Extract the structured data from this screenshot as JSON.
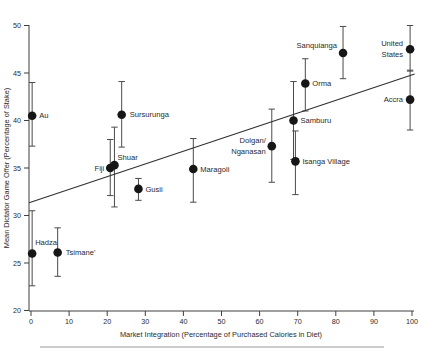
{
  "figure": {
    "background": "#ffffff",
    "axis_color": "#3f3f3f",
    "errorbar_color": "#4a4a4a",
    "point_color": "#161616",
    "text_color": "#2a2a2a",
    "trend_color": "#2f2f2f",
    "footer_rule_color": "#9a9a9a"
  },
  "chart_data": {
    "type": "scatter",
    "title": "",
    "xlabel": "Market Integration (Percentage of Purchased Calories in Diet)",
    "ylabel": "Mean Dictator Game Offer (Percentage of Stake)",
    "xlim": [
      0,
      100
    ],
    "ylim": [
      20,
      50
    ],
    "x_ticks": [
      0,
      10,
      20,
      30,
      40,
      50,
      60,
      70,
      80,
      90,
      100
    ],
    "y_ticks": [
      20,
      25,
      30,
      35,
      40,
      45,
      50
    ],
    "grid": false,
    "legend": null,
    "marker": "filled-circle",
    "error_bars": "vertical-with-caps",
    "points": [
      {
        "name": "Au",
        "x": 0.3,
        "y": 40.5,
        "err_low": 37.3,
        "err_high": 44.0,
        "label_side": "right",
        "label_dx": 7,
        "label_dy": 0,
        "label_lines": [
          "Au"
        ]
      },
      {
        "name": "Hadza",
        "x": 0.3,
        "y": 26.0,
        "err_low": 22.6,
        "err_high": 30.5,
        "label_side": "right",
        "label_dx": 3,
        "label_dy": -11,
        "label_lines": [
          "Hadza"
        ]
      },
      {
        "name": "Tsimane'",
        "x": 7.0,
        "y": 26.1,
        "err_low": 23.6,
        "err_high": 28.7,
        "label_side": "right",
        "label_dx": 8,
        "label_dy": 0,
        "label_lines": [
          "Tsimane'"
        ]
      },
      {
        "name": "Fiji",
        "x": 20.8,
        "y": 35.0,
        "err_low": 32.1,
        "err_high": 38.0,
        "label_side": "left",
        "label_dx": -6,
        "label_dy": 0,
        "label_lines": [
          "Fiji"
        ]
      },
      {
        "name": "Shuar",
        "x": 21.9,
        "y": 35.3,
        "err_low": 30.9,
        "err_high": 39.3,
        "label_side": "right",
        "label_dx": 3,
        "label_dy": -8,
        "label_lines": [
          "Shuar"
        ]
      },
      {
        "name": "Sursurunga",
        "x": 23.8,
        "y": 40.6,
        "err_low": 37.2,
        "err_high": 44.1,
        "label_side": "right",
        "label_dx": 8,
        "label_dy": 0,
        "label_lines": [
          "Sursurunga"
        ]
      },
      {
        "name": "Gusii",
        "x": 28.2,
        "y": 32.8,
        "err_low": 31.6,
        "err_high": 33.9,
        "label_side": "right",
        "label_dx": 7,
        "label_dy": 0,
        "label_lines": [
          "Gusii"
        ]
      },
      {
        "name": "Maragoli",
        "x": 42.6,
        "y": 34.9,
        "err_low": 31.4,
        "err_high": 38.1,
        "label_side": "right",
        "label_dx": 7,
        "label_dy": 0,
        "label_lines": [
          "Maragoli"
        ]
      },
      {
        "name": "Dolgan/Nganasan",
        "x": 63.2,
        "y": 37.3,
        "err_low": 33.5,
        "err_high": 41.2,
        "label_side": "left",
        "label_dx": -6,
        "label_dy": 0,
        "label_lines": [
          "Dolgan/",
          "Nganasan"
        ]
      },
      {
        "name": "Samburu",
        "x": 68.9,
        "y": 40.0,
        "err_low": 35.9,
        "err_high": 44.1,
        "label_side": "right",
        "label_dx": 7,
        "label_dy": 0,
        "label_lines": [
          "Samburu"
        ]
      },
      {
        "name": "Isanga Village",
        "x": 69.4,
        "y": 35.7,
        "err_low": 32.2,
        "err_high": 38.9,
        "label_side": "right",
        "label_dx": 7,
        "label_dy": 0,
        "label_lines": [
          "Isanga Village"
        ]
      },
      {
        "name": "Orma",
        "x": 72.0,
        "y": 43.9,
        "err_low": 41.0,
        "err_high": 46.5,
        "label_side": "right",
        "label_dx": 7,
        "label_dy": 0,
        "label_lines": [
          "Orma"
        ]
      },
      {
        "name": "Sanquianga",
        "x": 81.9,
        "y": 47.1,
        "err_low": 44.4,
        "err_high": 49.9,
        "label_side": "left",
        "label_dx": -6,
        "label_dy": -8,
        "label_lines": [
          "Sanquianga"
        ]
      },
      {
        "name": "Accra",
        "x": 99.5,
        "y": 42.2,
        "err_low": 39.0,
        "err_high": 45.3,
        "label_side": "left",
        "label_dx": -7,
        "label_dy": 0,
        "label_lines": [
          "Accra"
        ]
      },
      {
        "name": "United States",
        "x": 99.5,
        "y": 47.5,
        "err_low": 45.2,
        "err_high": 50.0,
        "label_side": "left",
        "label_dx": -7,
        "label_dy": 0,
        "label_lines": [
          "United",
          "States"
        ]
      }
    ],
    "trend_line": {
      "type": "linear",
      "y_at_x0": 31.4,
      "y_at_x100": 44.8
    },
    "footer_rule": true
  }
}
